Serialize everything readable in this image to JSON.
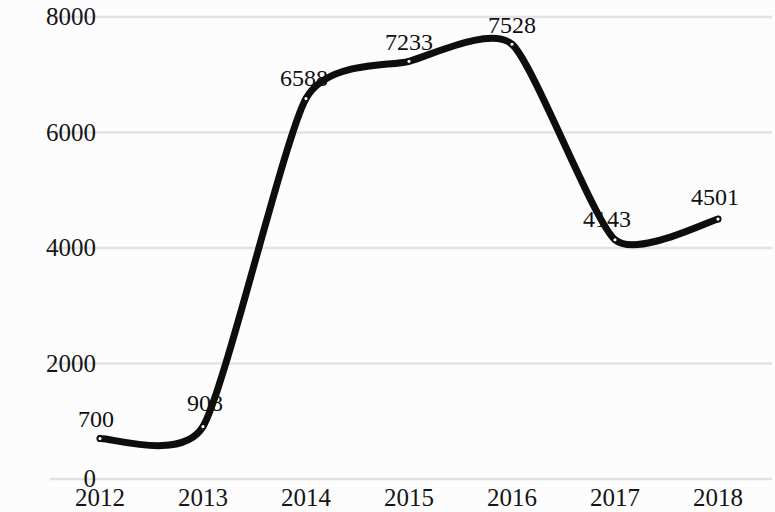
{
  "chart_data": {
    "type": "line",
    "title": "",
    "subtitle": "",
    "xlabel": "",
    "ylabel": "",
    "categories": [
      "2012",
      "2013",
      "2014",
      "2015",
      "2016",
      "2017",
      "2018"
    ],
    "values": [
      700,
      908,
      6588,
      7233,
      7528,
      4143,
      4501
    ],
    "series": [
      {
        "name": "",
        "values": [
          700,
          908,
          6588,
          7233,
          7528,
          4143,
          4501
        ]
      }
    ],
    "point_labels": [
      "700",
      "908",
      "6588",
      "7233",
      "7528",
      "4143",
      "4501"
    ],
    "ylim": [
      0,
      8000
    ],
    "yticks": [
      0,
      2000,
      4000,
      6000,
      8000
    ],
    "ytick_labels": [
      "0",
      "2000",
      "4000",
      "6000",
      "8000"
    ],
    "xtick_labels": [
      "2012",
      "2013",
      "2014",
      "2015",
      "2016",
      "2017",
      "2018"
    ],
    "grid": true,
    "grid_axis": "y",
    "legend": false,
    "legend_position": "none",
    "line_color": "#0d0d0d",
    "line_width": 7,
    "marker": "circle",
    "marker_color": "#0d0d0d",
    "grid_color": "#e3e3e3",
    "background_color": "#fdfdfd",
    "text_color": "#151515",
    "smoothing": "spline"
  }
}
